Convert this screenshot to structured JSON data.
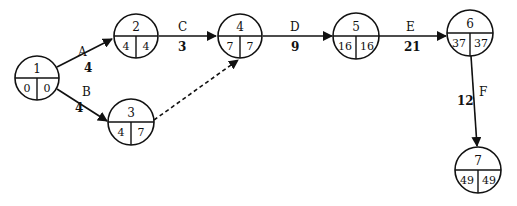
{
  "diagram": {
    "type": "activity-on-arrow network (CPM)",
    "colors": {
      "stroke": "#111111",
      "background": "#ffffff"
    },
    "nodes": [
      {
        "id": "1",
        "es": "0",
        "lf": "0",
        "cx": 37,
        "cy": 78
      },
      {
        "id": "2",
        "es": "4",
        "lf": "4",
        "cx": 136,
        "cy": 36
      },
      {
        "id": "3",
        "es": "4",
        "lf": "7",
        "cx": 131,
        "cy": 122
      },
      {
        "id": "4",
        "es": "7",
        "lf": "7",
        "cx": 240,
        "cy": 36
      },
      {
        "id": "5",
        "es": "16",
        "lf": "16",
        "cx": 356,
        "cy": 36
      },
      {
        "id": "6",
        "es": "37",
        "lf": "37",
        "cx": 470,
        "cy": 33
      },
      {
        "id": "7",
        "es": "49",
        "lf": "49",
        "cx": 478,
        "cy": 170
      }
    ],
    "activities": [
      {
        "name": "A",
        "duration": "4",
        "from": "1",
        "to": "2",
        "dummy": false
      },
      {
        "name": "B",
        "duration": "4",
        "from": "1",
        "to": "3",
        "dummy": false
      },
      {
        "name": "C",
        "duration": "3",
        "from": "2",
        "to": "4",
        "dummy": false
      },
      {
        "name": "D",
        "duration": "9",
        "from": "4",
        "to": "5",
        "dummy": false
      },
      {
        "name": "E",
        "duration": "21",
        "from": "5",
        "to": "6",
        "dummy": false
      },
      {
        "name": "F",
        "duration": "12",
        "from": "6",
        "to": "7",
        "dummy": false
      },
      {
        "name": "",
        "duration": "",
        "from": "3",
        "to": "4",
        "dummy": true
      }
    ]
  }
}
